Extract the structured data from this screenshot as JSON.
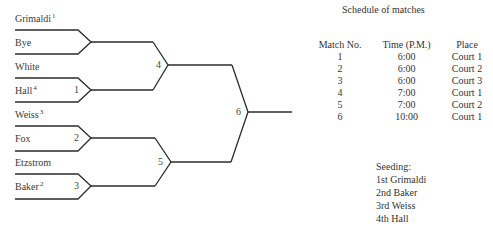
{
  "bracket": {
    "entrants": [
      {
        "name": "Grimaldi",
        "seed": "1"
      },
      {
        "name": "Bye",
        "seed": ""
      },
      {
        "name": "White",
        "seed": ""
      },
      {
        "name": "Hall",
        "seed": "4"
      },
      {
        "name": "Weiss",
        "seed": "3"
      },
      {
        "name": "Fox",
        "seed": ""
      },
      {
        "name": "Etzstrom",
        "seed": ""
      },
      {
        "name": "Baker",
        "seed": "2"
      }
    ],
    "match_numbers": {
      "m1": "1",
      "m2": "2",
      "m3": "3",
      "m4": "4",
      "m5": "5",
      "m6": "6"
    },
    "line_color": "#2b2b2b"
  },
  "schedule": {
    "title": "Schedule of matches",
    "headers": [
      "Match No.",
      "Time (P.M.)",
      "Place"
    ],
    "rows": [
      [
        "1",
        "6:00",
        "Court 1"
      ],
      [
        "2",
        "6:00",
        "Court 2"
      ],
      [
        "3",
        "6:00",
        "Court 3"
      ],
      [
        "4",
        "7:00",
        "Court 1"
      ],
      [
        "5",
        "7:00",
        "Court 2"
      ],
      [
        "6",
        "10:00",
        "Court 1"
      ]
    ]
  },
  "seeding": {
    "title": "Seeding:",
    "items": [
      "1st Grimaldi",
      "2nd Baker",
      "3rd Weiss",
      "4th Hall"
    ]
  }
}
